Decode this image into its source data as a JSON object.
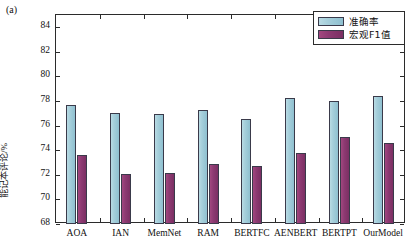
{
  "figure": {
    "panel_label": "(a)",
    "ylabel": "能记本评论/%"
  },
  "legend": {
    "position": "top-right",
    "items": [
      {
        "label": "准确率",
        "color": "#8fc0d0",
        "name": "accuracy"
      },
      {
        "label": "宏观F1值",
        "color": "#8d3a72",
        "name": "macro-f1"
      }
    ]
  },
  "chart_data": {
    "type": "bar",
    "title": "",
    "xlabel": "",
    "ylabel": "能记本评论/%",
    "ylim": [
      68,
      85
    ],
    "yticks": [
      68,
      70,
      72,
      74,
      76,
      78,
      80,
      82,
      84
    ],
    "grid": false,
    "legend_position": "top-right",
    "categories": [
      "AOA",
      "IAN",
      "MemNet",
      "RAM",
      "BERTFC",
      "AENBERT",
      "BERTPT",
      "OurModel"
    ],
    "series": [
      {
        "name": "准确率",
        "color": "#8fc0d0",
        "values": [
          77.7,
          77.0,
          76.95,
          77.3,
          76.55,
          78.25,
          78.0,
          78.4
        ]
      },
      {
        "name": "宏观F1值",
        "color": "#8d3a72",
        "values": [
          73.6,
          72.1,
          72.15,
          72.85,
          72.75,
          73.75,
          75.1,
          74.6
        ]
      }
    ]
  }
}
